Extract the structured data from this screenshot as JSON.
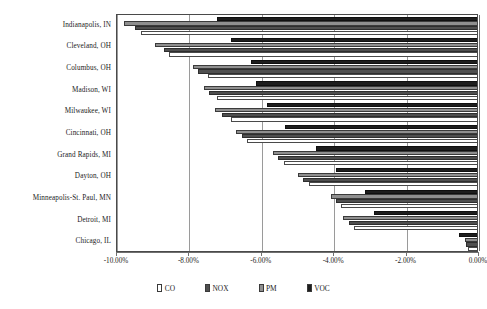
{
  "chart_data": {
    "type": "bar",
    "orientation": "horizontal",
    "title": "",
    "xlabel": "",
    "ylabel": "",
    "xlim": [
      -10.0,
      0.0
    ],
    "grid": true,
    "legend_position": "bottom",
    "xticks": [
      -10.0,
      -8.0,
      -6.0,
      -4.0,
      -2.0,
      0.0
    ],
    "xtick_labels": [
      "-10.00%",
      "-8.00%",
      "-6.00%",
      "-4.00%",
      "-2.00%",
      "0.00%"
    ],
    "categories": [
      "Indianapolis, IN",
      "Cleveland, OH",
      "Columbus, OH",
      "Madison, WI",
      "Milwaukee, WI",
      "Cincinnati, OH",
      "Grand Rapids, MI",
      "Dayton, OH",
      "Minneapolis-St. Paul, MN",
      "Detroit, MI",
      "Chicago, IL"
    ],
    "series": [
      {
        "name": "CO",
        "color": "#ffffff",
        "values": [
          -9.35,
          -8.55,
          -7.5,
          -7.25,
          -6.85,
          -6.4,
          -5.4,
          -4.7,
          -3.8,
          -3.45,
          -0.3
        ]
      },
      {
        "name": "NOX",
        "color": "#4f4f4f",
        "values": [
          -9.5,
          -8.7,
          -7.75,
          -7.45,
          -7.1,
          -6.55,
          -5.55,
          -4.85,
          -3.95,
          -3.6,
          -0.35
        ]
      },
      {
        "name": "PM",
        "color": "#8f8f8f",
        "values": [
          -9.8,
          -8.95,
          -7.9,
          -7.6,
          -7.3,
          -6.7,
          -5.7,
          -5.0,
          -4.1,
          -3.75,
          -0.4
        ]
      },
      {
        "name": "VOC",
        "color": "#1e1e1e",
        "values": [
          -7.25,
          -6.85,
          -6.3,
          -6.15,
          -5.85,
          -5.35,
          -4.5,
          -3.95,
          -3.15,
          -2.9,
          -0.55
        ]
      }
    ]
  },
  "legend": {
    "items": [
      {
        "label": "CO",
        "swatch": "co-swatch-icon"
      },
      {
        "label": "NOX",
        "swatch": "nox-swatch-icon"
      },
      {
        "label": "PM",
        "swatch": "pm-swatch-icon"
      },
      {
        "label": "VOC",
        "swatch": "voc-swatch-icon"
      }
    ]
  }
}
